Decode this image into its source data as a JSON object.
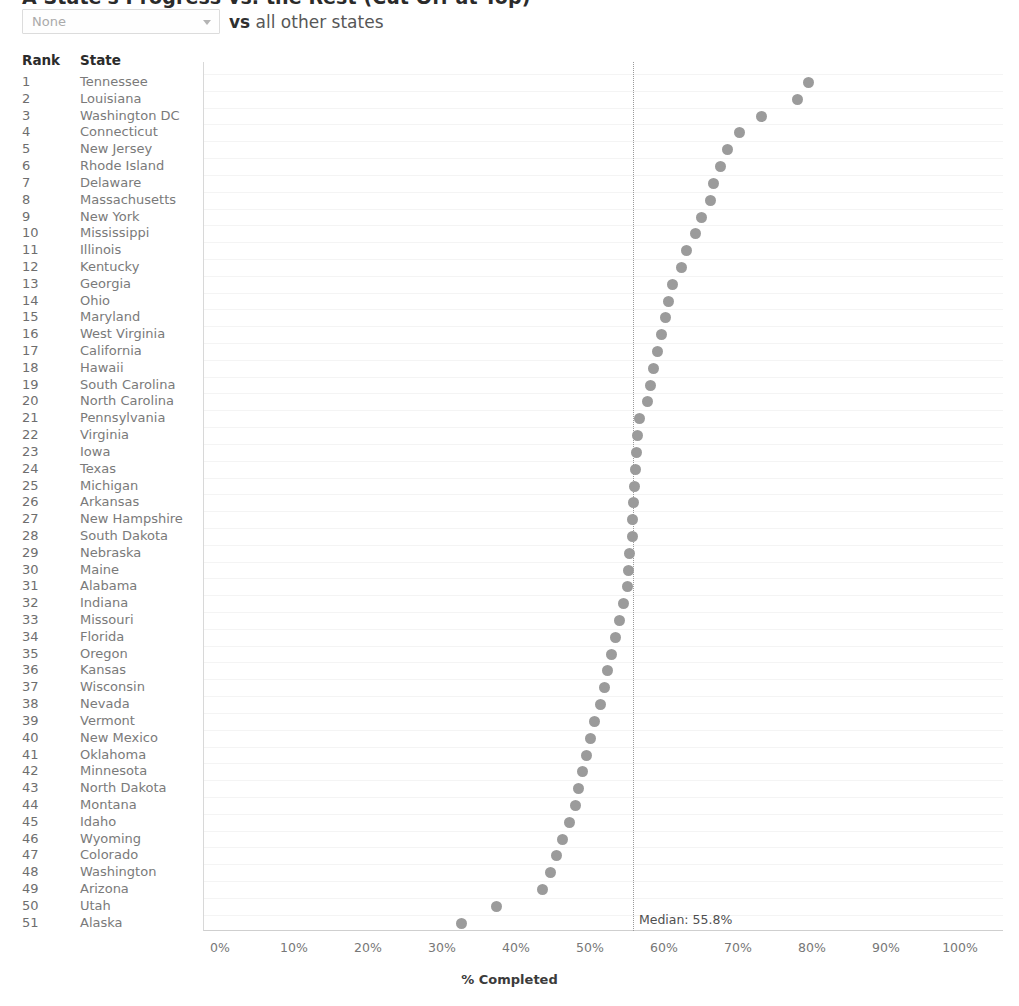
{
  "header": {
    "title": "A State's Progress vs. the Rest (Cut Off at Top)",
    "compare_label_bold": "vs",
    "compare_label_rest": " all other states",
    "dropdown": {
      "name": "state-selector",
      "value": "None",
      "caret_icon": "chevron-down-icon"
    }
  },
  "table": {
    "columns": [
      "Rank",
      "State"
    ]
  },
  "chart_data": {
    "type": "scatter",
    "title": "",
    "xlabel": "% Completed",
    "ylabel": "",
    "xlim": [
      0,
      100
    ],
    "xticks": [
      "0%",
      "10%",
      "20%",
      "30%",
      "40%",
      "50%",
      "60%",
      "70%",
      "80%",
      "90%",
      "100%"
    ],
    "xtick_values": [
      0,
      10,
      20,
      30,
      40,
      50,
      60,
      70,
      80,
      90,
      100
    ],
    "grid": true,
    "legend": "none",
    "orientation": "horizontal-dot-plot",
    "median": {
      "label": "Median: 55.8%",
      "value": 55.8
    },
    "dot_color": "#8d8d8d",
    "categories": [
      "Tennessee",
      "Louisiana",
      "Washington DC",
      "Connecticut",
      "New Jersey",
      "Rhode Island",
      "Delaware",
      "Massachusetts",
      "New York",
      "Mississippi",
      "Illinois",
      "Kentucky",
      "Georgia",
      "Ohio",
      "Maryland",
      "West Virginia",
      "California",
      "Hawaii",
      "South Carolina",
      "North Carolina",
      "Pennsylvania",
      "Virginia",
      "Iowa",
      "Texas",
      "Michigan",
      "Arkansas",
      "New Hampshire",
      "South Dakota",
      "Nebraska",
      "Maine",
      "Alabama",
      "Indiana",
      "Missouri",
      "Florida",
      "Oregon",
      "Kansas",
      "Wisconsin",
      "Nevada",
      "Vermont",
      "New Mexico",
      "Oklahoma",
      "Minnesota",
      "North Dakota",
      "Montana",
      "Idaho",
      "Wyoming",
      "Colorado",
      "Washington",
      "Arizona",
      "Utah",
      "Alaska"
    ],
    "ranks": [
      1,
      2,
      3,
      4,
      5,
      6,
      7,
      8,
      9,
      10,
      11,
      12,
      13,
      14,
      15,
      16,
      17,
      18,
      19,
      20,
      21,
      22,
      23,
      24,
      25,
      26,
      27,
      28,
      29,
      30,
      31,
      32,
      33,
      34,
      35,
      36,
      37,
      38,
      39,
      40,
      41,
      42,
      43,
      44,
      45,
      46,
      47,
      48,
      49,
      50,
      51
    ],
    "values": [
      79.5,
      78.0,
      73.2,
      70.2,
      68.6,
      67.7,
      66.7,
      66.3,
      65.0,
      64.2,
      63.0,
      62.3,
      61.2,
      60.6,
      60.2,
      59.6,
      59.1,
      58.6,
      58.2,
      57.8,
      56.7,
      56.4,
      56.3,
      56.2,
      56.0,
      55.9,
      55.8,
      55.7,
      55.4,
      55.2,
      55.0,
      54.5,
      54.0,
      53.5,
      52.9,
      52.4,
      52.0,
      51.4,
      50.6,
      50.0,
      49.5,
      49.0,
      48.5,
      48.0,
      47.2,
      46.3,
      45.5,
      44.7,
      43.6,
      37.4,
      32.7
    ]
  }
}
